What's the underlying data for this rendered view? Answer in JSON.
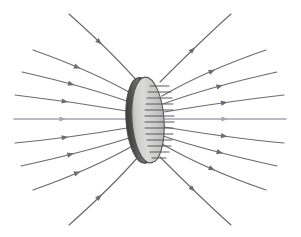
{
  "figure": {
    "width": 301,
    "height": 237,
    "background_color": "#ffffff",
    "caption": ""
  },
  "colors": {
    "field_line": "#6b6b73",
    "field_line_axis": "#a5a5ad",
    "disk_fill_light": "#d8d8d6",
    "disk_fill_mid": "#c2c2c0",
    "disk_fill_dark": "#a8a8a6",
    "disk_rim_dark": "#4d4d4d",
    "disk_edge": "#555555",
    "disk_stub": "#5a5a60",
    "background": "#ffffff"
  },
  "disk": {
    "label": "circular disk",
    "center_x": 148,
    "center_y": 120,
    "radius_x": 16,
    "radius_y": 43,
    "tilt_deg": -4,
    "rim_thickness": 6,
    "internal_line_count": 13
  },
  "chart_data": {
    "type": "line",
    "xlabel": "",
    "ylabel": "",
    "grid": false,
    "legend_position": "none",
    "xlim": [
      0,
      301
    ],
    "ylim": [
      0,
      237
    ],
    "flow_direction": "left-to-right",
    "annotations": [
      "Field lines converge from the left and pass through the disk",
      "Field lines diverge to the right after the disk",
      "Arrowheads indicate direction of flow toward and away from the disk"
    ],
    "series": [
      {
        "name": "line-top-1",
        "arrow_t": 0.46,
        "points": [
          [
            69,
            14
          ],
          [
            96,
            38
          ],
          [
            124,
            66
          ],
          [
            138,
            82
          ]
        ]
      },
      {
        "name": "line-top-2",
        "arrow_t": 0.45,
        "points": [
          [
            33,
            50
          ],
          [
            70,
            63
          ],
          [
            110,
            81
          ],
          [
            136,
            96
          ]
        ]
      },
      {
        "name": "line-top-3",
        "arrow_t": 0.46,
        "points": [
          [
            22,
            72
          ],
          [
            62,
            81
          ],
          [
            105,
            93
          ],
          [
            135,
            104
          ]
        ]
      },
      {
        "name": "line-top-4",
        "arrow_t": 0.45,
        "points": [
          [
            15,
            95
          ],
          [
            58,
            100
          ],
          [
            104,
            107
          ],
          [
            133,
            112
          ]
        ]
      },
      {
        "name": "line-axis-left",
        "arrow_t": 0.44,
        "points": [
          [
            14,
            119
          ],
          [
            60,
            119
          ],
          [
            105,
            119
          ],
          [
            132,
            119
          ]
        ]
      },
      {
        "name": "line-bot-4",
        "arrow_t": 0.45,
        "points": [
          [
            15,
            143
          ],
          [
            58,
            139
          ],
          [
            104,
            132
          ],
          [
            133,
            127
          ]
        ]
      },
      {
        "name": "line-bot-3",
        "arrow_t": 0.46,
        "points": [
          [
            21,
            166
          ],
          [
            62,
            157
          ],
          [
            105,
            146
          ],
          [
            135,
            136
          ]
        ]
      },
      {
        "name": "line-bot-2",
        "arrow_t": 0.45,
        "points": [
          [
            33,
            190
          ],
          [
            70,
            177
          ],
          [
            110,
            159
          ],
          [
            136,
            144
          ]
        ]
      },
      {
        "name": "line-bot-1",
        "arrow_t": 0.46,
        "points": [
          [
            69,
            225
          ],
          [
            96,
            201
          ],
          [
            124,
            173
          ],
          [
            138,
            157
          ]
        ]
      },
      {
        "name": "line-top-1-right",
        "arrow_t": 0.5,
        "points": [
          [
            160,
            82
          ],
          [
            176,
            66
          ],
          [
            204,
            38
          ],
          [
            231,
            14
          ]
        ]
      },
      {
        "name": "line-top-2-right",
        "arrow_t": 0.52,
        "points": [
          [
            162,
            96
          ],
          [
            188,
            81
          ],
          [
            228,
            63
          ],
          [
            266,
            50
          ]
        ]
      },
      {
        "name": "line-top-3-right",
        "arrow_t": 0.53,
        "points": [
          [
            163,
            104
          ],
          [
            193,
            93
          ],
          [
            236,
            81
          ],
          [
            277,
            72
          ]
        ]
      },
      {
        "name": "line-top-4-right",
        "arrow_t": 0.53,
        "points": [
          [
            164,
            112
          ],
          [
            194,
            107
          ],
          [
            240,
            100
          ],
          [
            284,
            95
          ]
        ]
      },
      {
        "name": "line-axis-right",
        "arrow_t": 0.52,
        "points": [
          [
            165,
            119
          ],
          [
            200,
            119
          ],
          [
            245,
            119
          ],
          [
            286,
            119
          ]
        ]
      },
      {
        "name": "line-bot-4-right",
        "arrow_t": 0.53,
        "points": [
          [
            164,
            127
          ],
          [
            194,
            132
          ],
          [
            240,
            139
          ],
          [
            284,
            143
          ]
        ]
      },
      {
        "name": "line-bot-3-right",
        "arrow_t": 0.53,
        "points": [
          [
            163,
            136
          ],
          [
            193,
            146
          ],
          [
            236,
            157
          ],
          [
            277,
            166
          ]
        ]
      },
      {
        "name": "line-bot-2-right",
        "arrow_t": 0.52,
        "points": [
          [
            162,
            144
          ],
          [
            188,
            159
          ],
          [
            228,
            177
          ],
          [
            266,
            190
          ]
        ]
      },
      {
        "name": "line-bot-1-right",
        "arrow_t": 0.5,
        "points": [
          [
            160,
            157
          ],
          [
            176,
            173
          ],
          [
            204,
            201
          ],
          [
            231,
            225
          ]
        ]
      }
    ],
    "disk_internal_lines": [
      {
        "y": 86,
        "x1": 150,
        "x2": 169
      },
      {
        "y": 92,
        "x1": 148,
        "x2": 171
      },
      {
        "y": 98,
        "x1": 147,
        "x2": 172
      },
      {
        "y": 104,
        "x1": 146,
        "x2": 173
      },
      {
        "y": 110,
        "x1": 145,
        "x2": 173
      },
      {
        "y": 116,
        "x1": 145,
        "x2": 174
      },
      {
        "y": 122,
        "x1": 145,
        "x2": 174
      },
      {
        "y": 128,
        "x1": 145,
        "x2": 173
      },
      {
        "y": 134,
        "x1": 146,
        "x2": 173
      },
      {
        "y": 140,
        "x1": 147,
        "x2": 172
      },
      {
        "y": 146,
        "x1": 148,
        "x2": 171
      },
      {
        "y": 152,
        "x1": 150,
        "x2": 169
      },
      {
        "y": 158,
        "x1": 152,
        "x2": 166
      }
    ]
  }
}
